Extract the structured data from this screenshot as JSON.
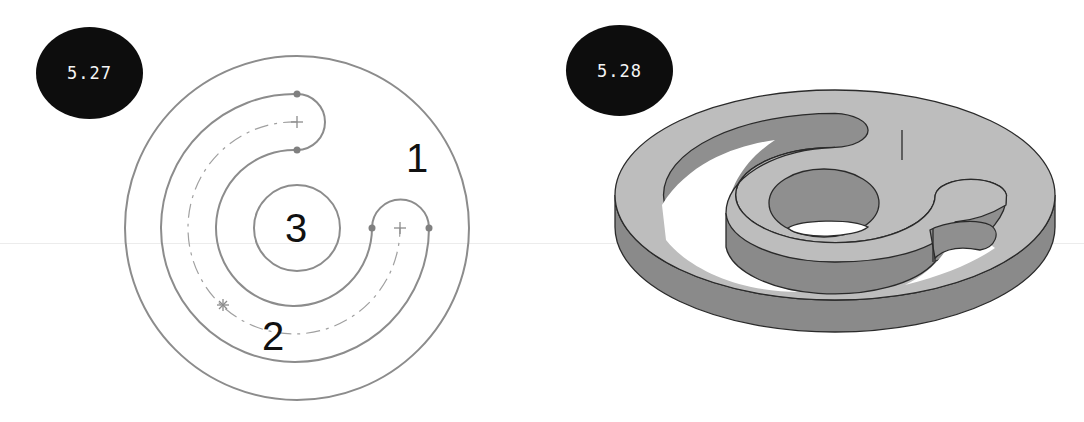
{
  "figures": [
    {
      "id": "fig-5-27",
      "badge": "5.27",
      "type": "2D sketch",
      "region_labels": [
        {
          "text": "1",
          "meaning": "outer region"
        },
        {
          "text": "2",
          "meaning": "slot region"
        },
        {
          "text": "3",
          "meaning": "inner circle region"
        }
      ]
    },
    {
      "id": "fig-5-28",
      "badge": "5.28",
      "type": "3D extruded part"
    }
  ],
  "colors": {
    "badge_bg": "#0d0d0d",
    "badge_text": "#f4f4f4",
    "sketch_line": "#8c8c8c",
    "sketch_point": "#808080",
    "top_face": "#bdbdbd",
    "side_face": "#8a8a8a",
    "inner_wall": "#8f8f8f",
    "edge": "#2a2a2a"
  }
}
